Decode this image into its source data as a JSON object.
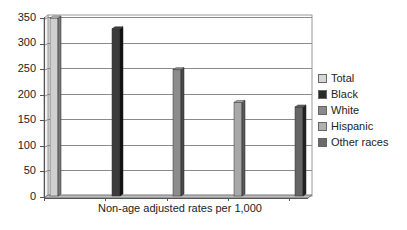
{
  "chart_data": {
    "type": "bar",
    "title": "",
    "xlabel": "Non-age adjusted rates per 1,000",
    "ylabel": "",
    "ylim": [
      0,
      350
    ],
    "yticks": [
      0,
      50,
      100,
      150,
      200,
      250,
      300,
      350
    ],
    "categories": [
      "Non-age adjusted rates per 1,000"
    ],
    "series": [
      {
        "name": "Total",
        "values": [
          348
        ],
        "color": "#cfcfcf",
        "side": "#7a7a7a"
      },
      {
        "name": "Black",
        "values": [
          327
        ],
        "color": "#3c3c3c",
        "side": "#111111"
      },
      {
        "name": "White",
        "values": [
          247
        ],
        "color": "#8c8c8c",
        "side": "#4a4a4a"
      },
      {
        "name": "Hispanic",
        "values": [
          183
        ],
        "color": "#a8a8a8",
        "side": "#5a5a5a"
      },
      {
        "name": "Other races",
        "values": [
          174
        ],
        "color": "#666666",
        "side": "#222222"
      }
    ],
    "grid": true,
    "legend_position": "right",
    "style": "3d-column"
  },
  "legend": {
    "items": [
      {
        "label": "Total",
        "color": "#d6d6d6"
      },
      {
        "label": "Black",
        "color": "#2a2a2a"
      },
      {
        "label": "White",
        "color": "#8a8a8a"
      },
      {
        "label": "Hispanic",
        "color": "#b0b0b0"
      },
      {
        "label": "Other races",
        "color": "#6a6a6a"
      }
    ]
  },
  "axis": {
    "y_labels": [
      "350",
      "300",
      "250",
      "200",
      "150",
      "100",
      "50",
      "0"
    ],
    "x_label": "Non-age adjusted rates per 1,000"
  }
}
